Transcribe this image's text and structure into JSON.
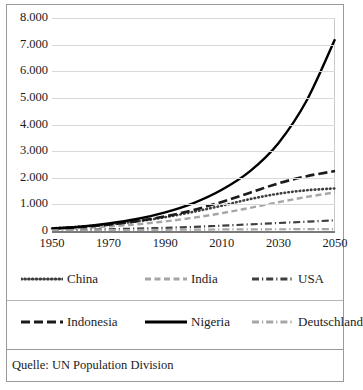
{
  "source": {
    "text": "Quelle: UN Population Division"
  },
  "chart_data": {
    "type": "line",
    "title": "",
    "subtitle": "",
    "xlabel": "",
    "ylabel": "",
    "grid": true,
    "legend_position": "bottom",
    "xlim": [
      1950,
      2050
    ],
    "ylim": [
      0,
      8000
    ],
    "x_ticks": [
      "1950",
      "1970",
      "1990",
      "2010",
      "2030",
      "2050"
    ],
    "y_ticks": [
      "8.000",
      "7.000",
      "6.000",
      "5.000",
      "4.000",
      "3.000",
      "2.000",
      "1.000",
      "0"
    ],
    "x": [
      1950,
      1960,
      1970,
      1980,
      1990,
      2000,
      2010,
      2020,
      2030,
      2040,
      2050
    ],
    "series": [
      {
        "name": "China",
        "style": "dotted",
        "color": "#3f3f3f",
        "values": [
          100,
          160,
          240,
          360,
          520,
          720,
          950,
          1200,
          1400,
          1530,
          1600
        ]
      },
      {
        "name": "India",
        "style": "dashed",
        "color": "#a6a6a6",
        "values": [
          70,
          110,
          170,
          250,
          360,
          500,
          670,
          870,
          1080,
          1280,
          1450
        ]
      },
      {
        "name": "USA",
        "style": "dashdot",
        "color": "#3f3f3f",
        "values": [
          30,
          45,
          65,
          90,
          120,
          155,
          200,
          250,
          300,
          350,
          400
        ]
      },
      {
        "name": "Indonesien",
        "style": "longdash",
        "color": "#1b1b1b",
        "values": [
          90,
          150,
          240,
          370,
          550,
          790,
          1090,
          1440,
          1790,
          2060,
          2250
        ]
      },
      {
        "name": "Nigeria",
        "style": "solid",
        "color": "#000000",
        "values": [
          90,
          160,
          280,
          450,
          700,
          1050,
          1550,
          2250,
          3300,
          4900,
          7200
        ]
      },
      {
        "name": "Deutschland",
        "style": "graydashdot",
        "color": "#a6a6a6",
        "values": [
          20,
          25,
          32,
          38,
          45,
          52,
          58,
          62,
          66,
          68,
          70
        ]
      }
    ]
  },
  "legend": {
    "rows": [
      [
        {
          "label": "China",
          "swatch": "dotted"
        },
        {
          "label": "India",
          "swatch": "dashed"
        },
        {
          "label": "USA",
          "swatch": "dashdot"
        }
      ],
      [
        {
          "label": "Indonesia",
          "swatch": "longdash"
        },
        {
          "label": "Nigeria",
          "swatch": "solid"
        },
        {
          "label": "Deutschland",
          "swatch": "graydashdot"
        }
      ]
    ]
  }
}
